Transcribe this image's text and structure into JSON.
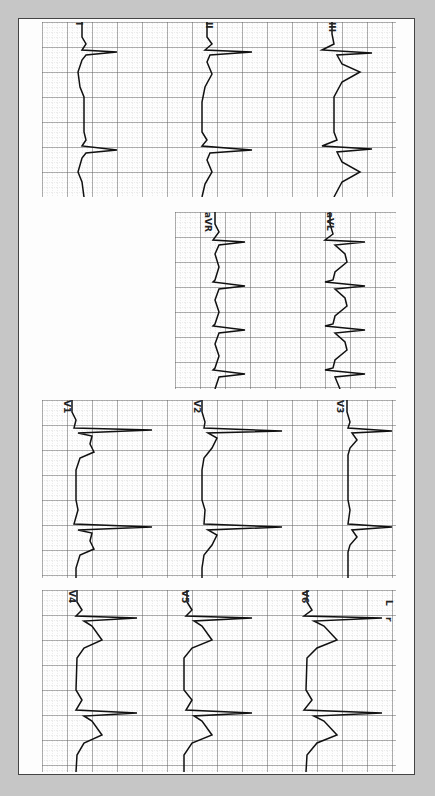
{
  "figure": {
    "orientation": "time axis runs top-to-bottom; amplitude runs left-to-right",
    "background_color": "#c6c6c6",
    "paper_color": "#fdfdfd",
    "grid_major_color": "#555555",
    "grid_minor_color": "#b0b0b0",
    "trace_color": "#111111"
  },
  "blocks": [
    {
      "id": "block-1",
      "leads": [
        {
          "label": "I",
          "beats": 3
        },
        {
          "label": "II",
          "beats": 3
        },
        {
          "label": "III",
          "beats": 3
        }
      ]
    },
    {
      "id": "block-2",
      "leads": [
        {
          "label": "aVR",
          "beats": 4
        },
        {
          "label": "aVL",
          "beats": 4
        }
      ]
    },
    {
      "id": "block-3",
      "leads": [
        {
          "label": "V1",
          "beats": 3
        },
        {
          "label": "V2",
          "beats": 3
        },
        {
          "label": "V3",
          "beats": 3
        }
      ]
    },
    {
      "id": "block-4",
      "leads": [
        {
          "label": "V4",
          "beats": 3
        },
        {
          "label": "V5",
          "beats": 3
        },
        {
          "label": "V6",
          "beats": 3
        }
      ],
      "side_marks": [
        "L",
        "r"
      ]
    }
  ]
}
